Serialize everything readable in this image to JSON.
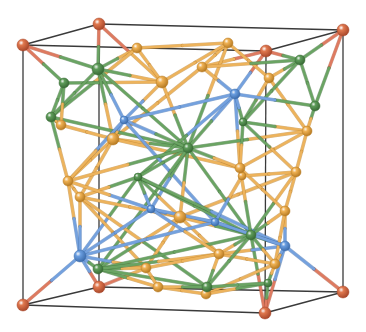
{
  "figure": {
    "type": "crystal-structure-3d-render",
    "width": 366,
    "height": 332,
    "background": "#ffffff"
  },
  "colors": {
    "cell_edge": "#3a3a3a",
    "atom_types": {
      "red": {
        "fill": "#e0784e",
        "dark": "#a8472a",
        "bond": "#de7a60"
      },
      "orange": {
        "fill": "#f0b254",
        "dark": "#b67a22",
        "bond": "#edb35c"
      },
      "green": {
        "fill": "#5e9c5a",
        "dark": "#386a35",
        "bond": "#6aa463"
      },
      "blue": {
        "fill": "#6a9ee0",
        "dark": "#3d6cab",
        "bond": "#74a1de"
      }
    }
  },
  "cell": {
    "corners": {
      "ftl": [
        23,
        45
      ],
      "btl": [
        99,
        24
      ],
      "btr": [
        343,
        30
      ],
      "ftr": [
        266,
        51
      ],
      "fbl": [
        23,
        305
      ],
      "bbl": [
        99,
        287
      ],
      "bbr": [
        343,
        292
      ],
      "fbr": [
        265,
        313
      ]
    },
    "edges": [
      [
        "ftl",
        "btl"
      ],
      [
        "btl",
        "btr"
      ],
      [
        "btr",
        "ftr"
      ],
      [
        "ftr",
        "ftl"
      ],
      [
        "fbl",
        "bbl"
      ],
      [
        "bbl",
        "bbr"
      ],
      [
        "bbr",
        "fbr"
      ],
      [
        "fbr",
        "fbl"
      ],
      [
        "ftl",
        "fbl"
      ],
      [
        "btl",
        "bbl"
      ],
      [
        "btr",
        "bbr"
      ],
      [
        "ftr",
        "fbr"
      ]
    ]
  },
  "atoms": [
    {
      "id": "c1",
      "type": "red",
      "x": 23,
      "y": 45,
      "r": 6
    },
    {
      "id": "c2",
      "type": "red",
      "x": 99,
      "y": 24,
      "r": 6
    },
    {
      "id": "c3",
      "type": "red",
      "x": 343,
      "y": 30,
      "r": 6
    },
    {
      "id": "c4",
      "type": "red",
      "x": 266,
      "y": 51,
      "r": 6
    },
    {
      "id": "c5",
      "type": "red",
      "x": 23,
      "y": 305,
      "r": 6
    },
    {
      "id": "c6",
      "type": "red",
      "x": 99,
      "y": 287,
      "r": 6
    },
    {
      "id": "c7",
      "type": "red",
      "x": 343,
      "y": 292,
      "r": 6
    },
    {
      "id": "c8",
      "type": "red",
      "x": 265,
      "y": 313,
      "r": 6
    },
    {
      "id": "o1",
      "type": "orange",
      "x": 137,
      "y": 48,
      "r": 5
    },
    {
      "id": "o2",
      "type": "orange",
      "x": 228,
      "y": 43,
      "r": 5
    },
    {
      "id": "o3",
      "type": "orange",
      "x": 202,
      "y": 67,
      "r": 5
    },
    {
      "id": "o4",
      "type": "orange",
      "x": 162,
      "y": 82,
      "r": 6
    },
    {
      "id": "o5",
      "type": "orange",
      "x": 269,
      "y": 78,
      "r": 5
    },
    {
      "id": "o6",
      "type": "orange",
      "x": 113,
      "y": 139,
      "r": 6
    },
    {
      "id": "o7",
      "type": "orange",
      "x": 307,
      "y": 131,
      "r": 5
    },
    {
      "id": "o8",
      "type": "orange",
      "x": 61,
      "y": 125,
      "r": 5
    },
    {
      "id": "o9",
      "type": "orange",
      "x": 68,
      "y": 181,
      "r": 5
    },
    {
      "id": "o10",
      "type": "orange",
      "x": 240,
      "y": 168,
      "r": 5
    },
    {
      "id": "o11",
      "type": "orange",
      "x": 296,
      "y": 172,
      "r": 5
    },
    {
      "id": "o12",
      "type": "orange",
      "x": 180,
      "y": 217,
      "r": 6
    },
    {
      "id": "o13",
      "type": "orange",
      "x": 80,
      "y": 197,
      "r": 5
    },
    {
      "id": "o14",
      "type": "orange",
      "x": 146,
      "y": 268,
      "r": 5
    },
    {
      "id": "o15",
      "type": "orange",
      "x": 219,
      "y": 254,
      "r": 5
    },
    {
      "id": "o16",
      "type": "orange",
      "x": 285,
      "y": 211,
      "r": 5
    },
    {
      "id": "o17",
      "type": "orange",
      "x": 158,
      "y": 287,
      "r": 5
    },
    {
      "id": "o18",
      "type": "orange",
      "x": 206,
      "y": 294,
      "r": 5
    },
    {
      "id": "o19",
      "type": "orange",
      "x": 275,
      "y": 264,
      "r": 5
    },
    {
      "id": "o20",
      "type": "orange",
      "x": 242,
      "y": 176,
      "r": 4
    },
    {
      "id": "g1",
      "type": "green",
      "x": 64,
      "y": 83,
      "r": 5
    },
    {
      "id": "g2",
      "type": "green",
      "x": 98,
      "y": 69,
      "r": 6
    },
    {
      "id": "g3",
      "type": "green",
      "x": 300,
      "y": 60,
      "r": 5
    },
    {
      "id": "g4",
      "type": "green",
      "x": 51,
      "y": 117,
      "r": 5
    },
    {
      "id": "g5",
      "type": "green",
      "x": 315,
      "y": 106,
      "r": 5
    },
    {
      "id": "g6",
      "type": "green",
      "x": 188,
      "y": 148,
      "r": 5
    },
    {
      "id": "g7",
      "type": "green",
      "x": 138,
      "y": 177,
      "r": 4
    },
    {
      "id": "g8",
      "type": "green",
      "x": 251,
      "y": 235,
      "r": 5
    },
    {
      "id": "g9",
      "type": "green",
      "x": 207,
      "y": 287,
      "r": 5
    },
    {
      "id": "g10",
      "type": "green",
      "x": 98,
      "y": 269,
      "r": 5
    },
    {
      "id": "g11",
      "type": "green",
      "x": 268,
      "y": 283,
      "r": 4
    },
    {
      "id": "g12",
      "type": "green",
      "x": 243,
      "y": 122,
      "r": 4
    },
    {
      "id": "b1",
      "type": "blue",
      "x": 235,
      "y": 94,
      "r": 5
    },
    {
      "id": "b2",
      "type": "blue",
      "x": 124,
      "y": 120,
      "r": 4
    },
    {
      "id": "b3",
      "type": "blue",
      "x": 80,
      "y": 256,
      "r": 6
    },
    {
      "id": "b4",
      "type": "blue",
      "x": 285,
      "y": 246,
      "r": 5
    },
    {
      "id": "b5",
      "type": "blue",
      "x": 215,
      "y": 222,
      "r": 4
    },
    {
      "id": "b6",
      "type": "blue",
      "x": 151,
      "y": 209,
      "r": 4
    }
  ],
  "bonds": [
    [
      "c1",
      "g1"
    ],
    [
      "c1",
      "g2"
    ],
    [
      "c2",
      "g2"
    ],
    [
      "c2",
      "o4"
    ],
    [
      "c3",
      "g3"
    ],
    [
      "c3",
      "g5"
    ],
    [
      "c4",
      "g3"
    ],
    [
      "c4",
      "o3"
    ],
    [
      "c4",
      "b1"
    ],
    [
      "c5",
      "b3"
    ],
    [
      "c6",
      "b3"
    ],
    [
      "c6",
      "o14"
    ],
    [
      "c7",
      "b4"
    ],
    [
      "c8",
      "b4"
    ],
    [
      "c8",
      "g8"
    ],
    [
      "c8",
      "g11"
    ],
    [
      "o1",
      "g2"
    ],
    [
      "o1",
      "o2"
    ],
    [
      "o1",
      "o4"
    ],
    [
      "o1",
      "g4"
    ],
    [
      "o2",
      "o3"
    ],
    [
      "o2",
      "o5"
    ],
    [
      "o2",
      "g6"
    ],
    [
      "o2",
      "o4"
    ],
    [
      "o3",
      "g3"
    ],
    [
      "o3",
      "b1"
    ],
    [
      "o3",
      "o6"
    ],
    [
      "o4",
      "g2"
    ],
    [
      "o4",
      "g6"
    ],
    [
      "o4",
      "b2"
    ],
    [
      "o5",
      "g3"
    ],
    [
      "o5",
      "o7"
    ],
    [
      "o5",
      "g12"
    ],
    [
      "g1",
      "g4"
    ],
    [
      "g1",
      "o4"
    ],
    [
      "g2",
      "g4"
    ],
    [
      "g2",
      "o6"
    ],
    [
      "g2",
      "g6"
    ],
    [
      "g3",
      "g5"
    ],
    [
      "g3",
      "g12"
    ],
    [
      "g5",
      "o7"
    ],
    [
      "g5",
      "b1"
    ],
    [
      "g4",
      "o8"
    ],
    [
      "g4",
      "o9"
    ],
    [
      "g4",
      "g6"
    ],
    [
      "o8",
      "o6"
    ],
    [
      "o6",
      "g6"
    ],
    [
      "o6",
      "o9"
    ],
    [
      "o6",
      "b2"
    ],
    [
      "o6",
      "o13"
    ],
    [
      "o6",
      "o10"
    ],
    [
      "b1",
      "b2"
    ],
    [
      "b1",
      "g6"
    ],
    [
      "b1",
      "o10"
    ],
    [
      "b1",
      "g7"
    ],
    [
      "b2",
      "g6"
    ],
    [
      "b2",
      "b5"
    ],
    [
      "b2",
      "o9"
    ],
    [
      "o7",
      "g12"
    ],
    [
      "o7",
      "o11"
    ],
    [
      "o7",
      "o10"
    ],
    [
      "o7",
      "g6"
    ],
    [
      "o11",
      "o16"
    ],
    [
      "o11",
      "g12"
    ],
    [
      "o11",
      "g8"
    ],
    [
      "o11",
      "o12"
    ],
    [
      "g6",
      "g7"
    ],
    [
      "g6",
      "o12"
    ],
    [
      "g6",
      "g8"
    ],
    [
      "g6",
      "b6"
    ],
    [
      "g6",
      "o10"
    ],
    [
      "g6",
      "o9"
    ],
    [
      "g6",
      "g10"
    ],
    [
      "g7",
      "o13"
    ],
    [
      "g7",
      "b3"
    ],
    [
      "g7",
      "o12"
    ],
    [
      "g7",
      "g8"
    ],
    [
      "g7",
      "b4"
    ],
    [
      "o9",
      "o13"
    ],
    [
      "o9",
      "b3"
    ],
    [
      "o13",
      "b3"
    ],
    [
      "o13",
      "o14"
    ],
    [
      "o13",
      "g9"
    ],
    [
      "o13",
      "o12"
    ],
    [
      "o12",
      "o15"
    ],
    [
      "o12",
      "b5"
    ],
    [
      "o12",
      "o14"
    ],
    [
      "o12",
      "g10"
    ],
    [
      "o12",
      "g8"
    ],
    [
      "o12",
      "b6"
    ],
    [
      "b3",
      "g10"
    ],
    [
      "b3",
      "o14"
    ],
    [
      "b3",
      "b5"
    ],
    [
      "b3",
      "b6"
    ],
    [
      "g10",
      "o14"
    ],
    [
      "g10",
      "o17"
    ],
    [
      "g10",
      "g9"
    ],
    [
      "g10",
      "g8"
    ],
    [
      "g10",
      "o15"
    ],
    [
      "o14",
      "o17"
    ],
    [
      "o14",
      "o15"
    ],
    [
      "o17",
      "o18"
    ],
    [
      "o17",
      "g9"
    ],
    [
      "o18",
      "g9"
    ],
    [
      "o18",
      "o19"
    ],
    [
      "o18",
      "g11"
    ],
    [
      "o15",
      "g9"
    ],
    [
      "o15",
      "g8"
    ],
    [
      "o15",
      "o19"
    ],
    [
      "o15",
      "b4"
    ],
    [
      "g8",
      "b4"
    ],
    [
      "g8",
      "o16"
    ],
    [
      "g8",
      "o19"
    ],
    [
      "g8",
      "g9"
    ],
    [
      "o16",
      "b4"
    ],
    [
      "o16",
      "o19"
    ],
    [
      "b4",
      "o19"
    ],
    [
      "g11",
      "o19"
    ],
    [
      "g11",
      "g9"
    ],
    [
      "b5",
      "b6"
    ],
    [
      "b5",
      "g8"
    ],
    [
      "b5",
      "b4"
    ],
    [
      "b6",
      "o9"
    ],
    [
      "b6",
      "g7"
    ],
    [
      "b6",
      "o15"
    ],
    [
      "o10",
      "g8"
    ],
    [
      "o10",
      "o16"
    ],
    [
      "o10",
      "o20"
    ],
    [
      "o20",
      "o11"
    ],
    [
      "o20",
      "b5"
    ],
    [
      "g12",
      "b1"
    ],
    [
      "g12",
      "o10"
    ],
    [
      "g1",
      "o8"
    ],
    [
      "g2",
      "b2"
    ]
  ]
}
